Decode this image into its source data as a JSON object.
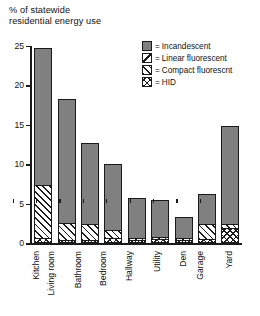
{
  "chart_title": "% of statewide\nresidential energy use",
  "legend": {
    "equals": "=",
    "items": [
      {
        "pattern": "solid",
        "label": "Incandescent",
        "swatch_name": "legend-swatch-incandescent"
      },
      {
        "pattern": "linear",
        "label": "Linear fluorescent",
        "swatch_name": "legend-swatch-linear-fluorescent"
      },
      {
        "pattern": "compact",
        "label": "Compact fluorescnt",
        "swatch_name": "legend-swatch-compact-fluorescent"
      },
      {
        "pattern": "hid",
        "label": "HID",
        "swatch_name": "legend-swatch-hid"
      }
    ]
  },
  "chart_data": {
    "type": "bar",
    "subtype": "stacked",
    "title": "% of statewide residential energy use",
    "xlabel": "",
    "ylabel": "% of statewide residential energy use",
    "ylim": [
      0,
      25
    ],
    "yticks": [
      0,
      5,
      10,
      15,
      20,
      25
    ],
    "ytick_labels": [
      "0",
      "5",
      "10",
      "15",
      "20",
      "25"
    ],
    "grid": false,
    "legend_position": "top-right",
    "categories": [
      "Kitchen",
      "Living room",
      "Bathroom",
      "Bedroom",
      "Hallway",
      "Utility",
      "Den",
      "Garage",
      "Yard"
    ],
    "series": [
      {
        "name": "HID",
        "pattern": "hid",
        "values": [
          0.5,
          0.2,
          0.2,
          0.4,
          0.2,
          0.3,
          0.2,
          0.3,
          1.7
        ]
      },
      {
        "name": "Compact fluorescnt",
        "pattern": "compact",
        "values": [
          6.7,
          2.1,
          2.1,
          1.1,
          0.3,
          0.3,
          0.2,
          2.0,
          0.6
        ]
      },
      {
        "name": "Linear fluorescent",
        "pattern": "linear",
        "values": [
          0.0,
          0.0,
          0.0,
          0.0,
          0.0,
          0.0,
          0.0,
          0.0,
          0.0
        ]
      },
      {
        "name": "Incandescent",
        "pattern": "solid",
        "values": [
          17.6,
          16.0,
          10.4,
          8.5,
          5.3,
          4.9,
          2.9,
          3.9,
          12.6
        ]
      }
    ],
    "totals": [
      24.8,
      18.3,
      12.7,
      10.0,
      5.8,
      5.5,
      3.3,
      6.2,
      14.9
    ]
  },
  "colors": {
    "incandescent_fill": "#808080",
    "outline": "#1a1a1a",
    "background": "#ffffff",
    "text": "#111111"
  }
}
